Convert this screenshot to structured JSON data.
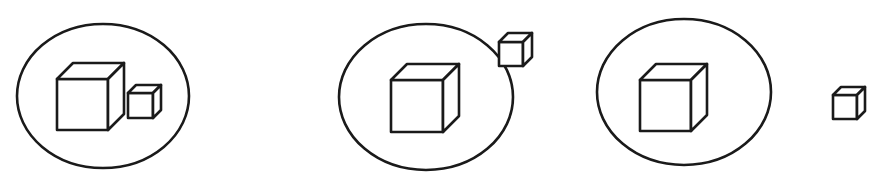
{
  "diagram": {
    "stroke_color": "#1a1a1a",
    "background": "#ffffff",
    "panels": [
      {
        "id": "panel-1",
        "small_cube_relation": "inside",
        "ellipse": {
          "cx": 103,
          "cy": 96,
          "rx": 86,
          "ry": 72
        },
        "large_cube": {
          "x": 57,
          "y": 79,
          "size": 51,
          "depth": 16
        },
        "small_cube": {
          "x": 128,
          "y": 93,
          "size": 25,
          "depth": 8
        }
      },
      {
        "id": "panel-2",
        "small_cube_relation": "on-boundary",
        "ellipse": {
          "cx": 426,
          "cy": 97,
          "rx": 87,
          "ry": 73
        },
        "large_cube": {
          "x": 391,
          "y": 80,
          "size": 52,
          "depth": 16
        },
        "small_cube": {
          "x": 499,
          "y": 42,
          "size": 24,
          "depth": 9
        }
      },
      {
        "id": "panel-3",
        "small_cube_relation": "outside",
        "ellipse": {
          "cx": 684,
          "cy": 92,
          "rx": 87,
          "ry": 73
        },
        "large_cube": {
          "x": 640,
          "y": 80,
          "size": 51,
          "depth": 16
        },
        "small_cube": {
          "x": 833,
          "y": 95,
          "size": 24,
          "depth": 8
        }
      }
    ]
  }
}
